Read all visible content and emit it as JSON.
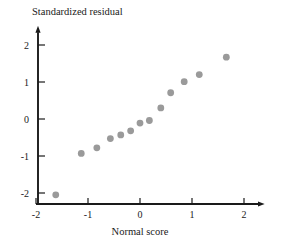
{
  "chart_data": {
    "type": "scatter",
    "title": "",
    "xlabel": "Normal score",
    "ylabel": "Standardized residual",
    "xlim": [
      -2.1,
      2.35
    ],
    "ylim": [
      -2.35,
      2.45
    ],
    "xticks": [
      -2,
      -1,
      0,
      1,
      2
    ],
    "xtick_labels": [
      "-2",
      "-1",
      "0",
      "1",
      "2"
    ],
    "yticks": [
      -2,
      -1,
      0,
      1,
      2
    ],
    "ytick_labels": [
      "-2",
      "-1",
      "0",
      "1",
      "2"
    ],
    "grid": false,
    "legend": null,
    "marker_color": "#9a9a9a",
    "marker_size": 4.6,
    "axis_color": "#1a1a1a",
    "points": [
      {
        "x": -1.62,
        "y": -2.05
      },
      {
        "x": -1.13,
        "y": -0.93
      },
      {
        "x": -0.83,
        "y": -0.78
      },
      {
        "x": -0.57,
        "y": -0.53
      },
      {
        "x": -0.37,
        "y": -0.43
      },
      {
        "x": -0.18,
        "y": -0.32
      },
      {
        "x": 0.0,
        "y": -0.11
      },
      {
        "x": 0.18,
        "y": -0.04
      },
      {
        "x": 0.4,
        "y": 0.3
      },
      {
        "x": 0.59,
        "y": 0.71
      },
      {
        "x": 0.85,
        "y": 1.01
      },
      {
        "x": 1.14,
        "y": 1.2
      },
      {
        "x": 1.66,
        "y": 1.67
      }
    ]
  },
  "axes": {
    "x_title": "Normal score",
    "y_title": "Standardized residual"
  }
}
